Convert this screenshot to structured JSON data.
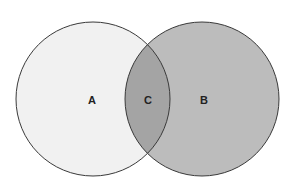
{
  "diagram": {
    "type": "venn",
    "regions": [
      {
        "id": "A",
        "label": "A",
        "fill": "#f1f1f1"
      },
      {
        "id": "B",
        "label": "B",
        "fill": "#bcbcbc"
      },
      {
        "id": "C",
        "label": "C",
        "fill": "#a4a4a4"
      }
    ],
    "stroke": "#3a3a3a"
  }
}
